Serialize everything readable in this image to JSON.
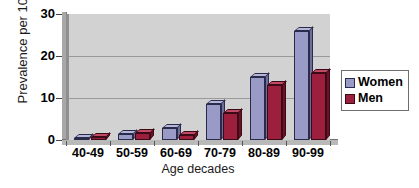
{
  "chart_data": {
    "type": "bar",
    "title": "",
    "xlabel": "Age decades",
    "ylabel": "Prevalence per 1000",
    "categories": [
      "40-49",
      "50-59",
      "60-69",
      "70-79",
      "80-89",
      "90-99"
    ],
    "series": [
      {
        "name": "Women",
        "color": "#9a9ac6",
        "values": [
          0.5,
          1.4,
          2.8,
          8.5,
          15.0,
          26.0
        ]
      },
      {
        "name": "Men",
        "color": "#9c1f3d",
        "values": [
          0.7,
          1.6,
          1.3,
          6.5,
          13.0,
          16.0
        ]
      }
    ],
    "ylim": [
      0,
      30
    ],
    "yticks": [
      "0",
      "10",
      "20",
      "30"
    ],
    "ytick_values": [
      0,
      10,
      20,
      30
    ],
    "grid": true,
    "legend_position": "right",
    "legend": [
      "Women",
      "Men"
    ]
  },
  "legend": {
    "items": [
      {
        "label": "Women"
      },
      {
        "label": "Men"
      }
    ]
  },
  "axes": {
    "y_title": "Prevalence per 1000",
    "x_title": "Age decades"
  }
}
